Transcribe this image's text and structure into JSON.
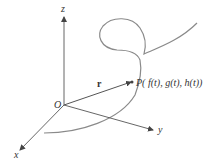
{
  "diagram": {
    "type": "3d-space-curve-position-vector",
    "axes": {
      "z": {
        "label": "z"
      },
      "y": {
        "label": "y"
      },
      "x": {
        "label": "x"
      },
      "origin": {
        "label": "O"
      }
    },
    "vector": {
      "label": "r"
    },
    "point": {
      "label": "P( f(t), g(t), h(t))"
    },
    "colors": {
      "axis": "#555555",
      "curve": "#8a8a8a",
      "vector": "#555555",
      "text": "#333333"
    }
  }
}
